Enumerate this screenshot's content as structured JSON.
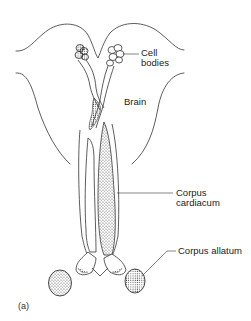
{
  "figure": {
    "panel_label": "(a)",
    "labels": [
      {
        "id": "cell-bodies",
        "lines": [
          "Cell",
          "bodies"
        ]
      },
      {
        "id": "brain",
        "lines": [
          "Brain"
        ]
      },
      {
        "id": "corpus-cardiacum",
        "lines": [
          "Corpus",
          "cardiacum"
        ]
      },
      {
        "id": "corpus-allatum",
        "lines": [
          "Corpus allatum"
        ]
      }
    ],
    "line_color": "#333333",
    "stipple_color": "#555555"
  }
}
